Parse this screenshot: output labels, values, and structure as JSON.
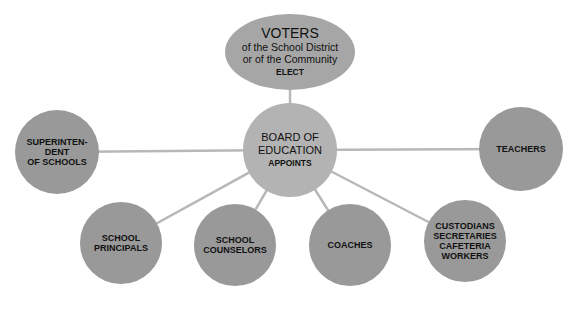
{
  "colors": {
    "background": "#ffffff",
    "outer_node": "#999999",
    "center_node": "#b3b3b3",
    "top_node": "#a6a6a6",
    "connector": "#b8b8b8",
    "text": "#111111"
  },
  "top_node": {
    "title": "VOTERS",
    "line1": "of the School District",
    "line2": "or of the Community",
    "action": "ELECT"
  },
  "center_node": {
    "line1": "BOARD OF",
    "line2": "EDUCATION",
    "action": "APPOINTS"
  },
  "appointees": [
    {
      "id": "superintendent",
      "lines": [
        "SUPERINTEN-",
        "DENT",
        "OF SCHOOLS"
      ]
    },
    {
      "id": "teachers",
      "lines": [
        "TEACHERS"
      ]
    },
    {
      "id": "principals",
      "lines": [
        "SCHOOL",
        "PRINCIPALS"
      ]
    },
    {
      "id": "counselors",
      "lines": [
        "SCHOOL",
        "COUNSELORS"
      ]
    },
    {
      "id": "coaches",
      "lines": [
        "COACHES"
      ]
    },
    {
      "id": "support-staff",
      "lines": [
        "CUSTODIANS",
        "SECRETARIES",
        "CAFETERIA",
        "WORKERS"
      ]
    }
  ]
}
